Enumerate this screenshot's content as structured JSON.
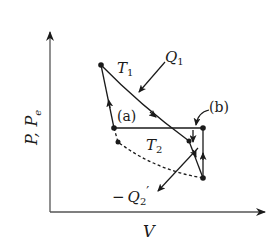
{
  "diagram": {
    "type": "thermodynamic-cycle-pv",
    "axes": {
      "x_label": "V",
      "y_label_main": "P,",
      "y_label_sub": "P",
      "y_label_sub_subscript": "e"
    },
    "labels": {
      "T1": "T",
      "T1_sub": "1",
      "T2": "T",
      "T2_sub": "2",
      "Q1": "Q",
      "Q1_sub": "1",
      "Q2_prefix": "−",
      "Q2": "Q",
      "Q2_sub": "2",
      "Q2_prime": "′",
      "a": "(a)",
      "b": "(b)"
    },
    "colors": {
      "ink": "#1a1a1a",
      "background": "#ffffff"
    }
  }
}
